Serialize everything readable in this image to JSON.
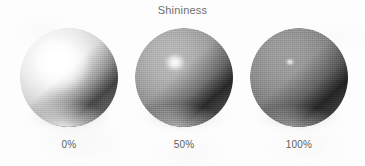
{
  "figure": {
    "title": "Shininess",
    "background_color": "#fdfdfd",
    "text_color": "#6e6e6e"
  },
  "spheres": [
    {
      "label": "0%",
      "shininess_percent": 0,
      "highlight": "broad diffuse sheen, upper-left",
      "highlight_size": "large",
      "body_tone": "#d6d6d6"
    },
    {
      "label": "50%",
      "shininess_percent": 50,
      "highlight": "focused specular spot, upper-left",
      "highlight_size": "medium",
      "body_tone": "#8d8d8d"
    },
    {
      "label": "100%",
      "shininess_percent": 100,
      "highlight": "tiny pinpoint specular, upper-left",
      "highlight_size": "small",
      "body_tone": "#7b7b7b"
    }
  ],
  "chart_data": {
    "type": "table",
    "title": "Shininess",
    "xlabel": "",
    "ylabel": "",
    "categories": [
      "0%",
      "50%",
      "100%"
    ],
    "values": [
      0,
      50,
      100
    ],
    "annotations": [
      "Rendered sphere with 0% shininess — wide, soft specular falloff",
      "Rendered sphere with 50% shininess — tighter, brighter specular",
      "Rendered sphere with 100% shininess — very small, intense specular"
    ]
  }
}
